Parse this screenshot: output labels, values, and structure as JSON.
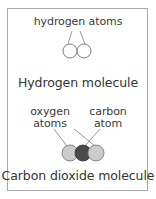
{
  "figure": {
    "title_text_present": false,
    "frame": {
      "border_color": "#a8a8a8",
      "background_color": "#ffffff"
    },
    "text_color": "#3a3a3a"
  },
  "panels": [
    {
      "id": "hydrogen",
      "callout_label": "hydrogen atoms",
      "caption": "Hydrogen molecule",
      "atoms": [
        {
          "name": "hydrogen-atom-left",
          "fill": "#ffffff",
          "stroke": "#6e6e6e",
          "cx": 70,
          "cy": 51,
          "r": 7
        },
        {
          "name": "hydrogen-atom-right",
          "fill": "#ffffff",
          "stroke": "#6e6e6e",
          "cx": 84,
          "cy": 51,
          "r": 7
        }
      ],
      "leader_lines": [
        {
          "from": "hydrogen atoms",
          "x1": 72,
          "y1": 31,
          "x2": 68,
          "y2": 44
        },
        {
          "from": "hydrogen atoms",
          "x1": 80,
          "y1": 31,
          "x2": 85,
          "y2": 44
        }
      ]
    },
    {
      "id": "carbon-dioxide",
      "callout_labels": [
        {
          "line1": "oxygen",
          "line2": "atoms"
        },
        {
          "line1": "carbon",
          "line2": "atom"
        }
      ],
      "caption": "Carbon dioxide molecule",
      "atoms": [
        {
          "name": "oxygen-atom-left",
          "fill": "#cccccc",
          "stroke": "#7a7a7a",
          "cx": 70,
          "cy": 153,
          "r": 8
        },
        {
          "name": "carbon-atom",
          "fill": "#4a4a4a",
          "stroke": "#3a3a3a",
          "cx": 83,
          "cy": 153,
          "r": 8
        },
        {
          "name": "oxygen-atom-right",
          "fill": "#cccccc",
          "stroke": "#7a7a7a",
          "cx": 96,
          "cy": 153,
          "r": 8
        }
      ],
      "leader_lines": [
        {
          "from": "oxygen atoms",
          "x1": 54,
          "y1": 129,
          "x2": 67,
          "y2": 146
        },
        {
          "from": "oxygen atoms",
          "x1": 74,
          "y1": 129,
          "x2": 95,
          "y2": 146
        },
        {
          "from": "carbon atom",
          "x1": 100,
          "y1": 129,
          "x2": 85,
          "y2": 146
        }
      ],
      "line_color": "#8a8a8a"
    }
  ]
}
